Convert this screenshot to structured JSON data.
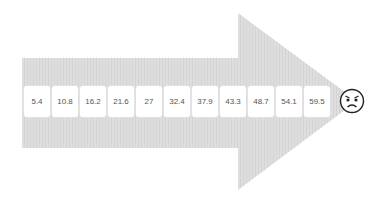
{
  "diagram": {
    "type": "progression-arrow",
    "arrow_color": "#dcdcdc",
    "values": [
      "5.4",
      "10.8",
      "16.2",
      "21.6",
      "27",
      "32.4",
      "37.9",
      "43.3",
      "48.7",
      "54.1",
      "59.5"
    ],
    "end_icon": "angry-face-icon"
  }
}
